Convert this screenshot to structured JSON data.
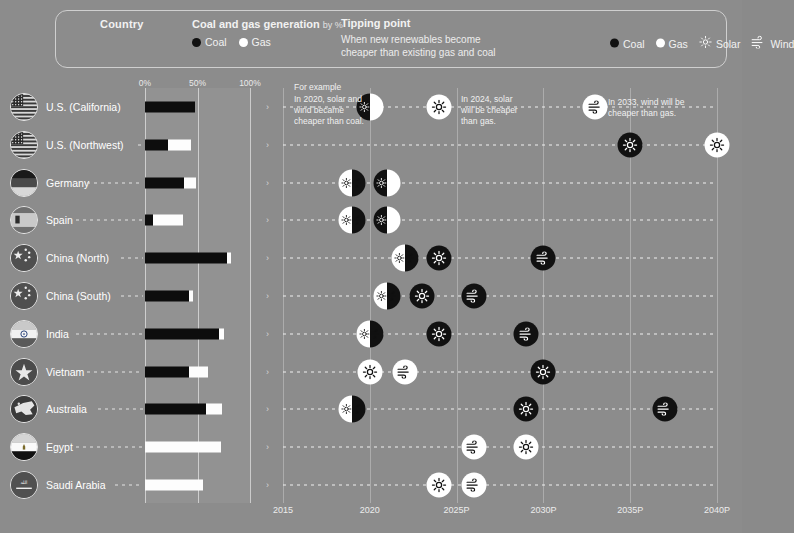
{
  "header": {
    "country_label": "Country",
    "generation_title": "Coal and gas generation",
    "generation_sub": "by %",
    "generation_legend": [
      {
        "name": "coal",
        "label": "Coal",
        "color": "#111111"
      },
      {
        "name": "gas",
        "label": "Gas",
        "color": "#ffffff"
      }
    ],
    "tipping_title": "Tipping point",
    "tipping_sub_line1": "When new renewables become",
    "tipping_sub_line2": "cheaper than existing gas and coal",
    "tipping_legend": [
      {
        "name": "coal",
        "label": "Coal",
        "icon": "filled-circle-icon"
      },
      {
        "name": "gas",
        "label": "Gas",
        "icon": "open-circle-icon"
      },
      {
        "name": "solar",
        "label": "Solar",
        "icon": "solar-icon"
      },
      {
        "name": "wind",
        "label": "Wind",
        "icon": "wind-icon"
      }
    ]
  },
  "bar_axis": {
    "ticks": [
      "0%",
      "50%",
      "100%"
    ],
    "values": [
      0,
      50,
      100
    ]
  },
  "timeline_axis": {
    "ticks": [
      "2015",
      "2020",
      "2025P",
      "2030P",
      "2035P",
      "2040P"
    ],
    "values": [
      2015,
      2020,
      2025,
      2030,
      2035,
      2040
    ],
    "min": 2015,
    "max": 2040
  },
  "annotations": [
    {
      "name": "for-example-label",
      "text": "For example"
    },
    {
      "name": "anno-2020",
      "line1": "In 2020, solar and",
      "line2": "wind became",
      "line3": "cheaper than coal."
    },
    {
      "name": "anno-2024",
      "line1": "In 2024, solar",
      "line2": "will be cheaper",
      "line3": "than gas."
    },
    {
      "name": "anno-2033",
      "line1": "In 2033, wind will be",
      "line2": "cheaper than gas.",
      "line3": ""
    }
  ],
  "chart_data": {
    "type": "bar",
    "xlabel": "",
    "ylabel": "",
    "categories": [
      "U.S. (California)",
      "U.S. (Northwest)",
      "Germany",
      "Spain",
      "China (North)",
      "China (South)",
      "India",
      "Vietnam",
      "Australia",
      "Egypt",
      "Saudi Arabia"
    ],
    "series": [
      {
        "name": "Coal",
        "values": [
          48,
          22,
          37,
          8,
          78,
          42,
          70,
          42,
          58,
          0,
          0
        ]
      },
      {
        "name": "Gas",
        "values": [
          0,
          22,
          12,
          28,
          4,
          4,
          5,
          18,
          15,
          72,
          55
        ]
      }
    ],
    "ylim": [
      0,
      100
    ],
    "grid": true,
    "legend": "top"
  },
  "rows": [
    {
      "name": "U.S. (California)",
      "flag": "usa-flag-icon",
      "coal": 48,
      "gas": 0,
      "markers": [
        {
          "year": 2020,
          "type": "solar-wind",
          "fill": "black"
        },
        {
          "year": 2024,
          "type": "solar",
          "fill": "white"
        },
        {
          "year": 2033,
          "type": "wind",
          "fill": "white"
        }
      ]
    },
    {
      "name": "U.S. (Northwest)",
      "flag": "usa-flag-icon",
      "coal": 22,
      "gas": 22,
      "markers": [
        {
          "year": 2035,
          "type": "solar",
          "fill": "black"
        },
        {
          "year": 2040,
          "type": "solar",
          "fill": "white"
        }
      ]
    },
    {
      "name": "Germany",
      "flag": "germany-flag-icon",
      "coal": 37,
      "gas": 12,
      "markers": [
        {
          "year": 2019,
          "type": "solar-wind",
          "fill": "white"
        },
        {
          "year": 2021,
          "type": "solar-wind",
          "fill": "black"
        }
      ]
    },
    {
      "name": "Spain",
      "flag": "spain-flag-icon",
      "coal": 8,
      "gas": 28,
      "markers": [
        {
          "year": 2019,
          "type": "solar-wind",
          "fill": "white"
        },
        {
          "year": 2021,
          "type": "solar-wind",
          "fill": "black"
        }
      ]
    },
    {
      "name": "China (North)",
      "flag": "china-flag-icon",
      "coal": 78,
      "gas": 4,
      "markers": [
        {
          "year": 2022,
          "type": "solar-wind",
          "fill": "white"
        },
        {
          "year": 2024,
          "type": "solar",
          "fill": "black"
        },
        {
          "year": 2030,
          "type": "wind",
          "fill": "black"
        }
      ]
    },
    {
      "name": "China (South)",
      "flag": "china-flag-icon",
      "coal": 42,
      "gas": 4,
      "markers": [
        {
          "year": 2021,
          "type": "solar-wind",
          "fill": "white"
        },
        {
          "year": 2023,
          "type": "solar",
          "fill": "black"
        },
        {
          "year": 2026,
          "type": "wind",
          "fill": "black"
        }
      ]
    },
    {
      "name": "India",
      "flag": "india-flag-icon",
      "coal": 70,
      "gas": 5,
      "markers": [
        {
          "year": 2020,
          "type": "solar-wind",
          "fill": "white"
        },
        {
          "year": 2024,
          "type": "solar",
          "fill": "black"
        },
        {
          "year": 2029,
          "type": "wind",
          "fill": "black"
        }
      ]
    },
    {
      "name": "Vietnam",
      "flag": "vietnam-flag-icon",
      "coal": 42,
      "gas": 18,
      "markers": [
        {
          "year": 2020,
          "type": "solar",
          "fill": "white"
        },
        {
          "year": 2022,
          "type": "wind",
          "fill": "white"
        },
        {
          "year": 2030,
          "type": "solar",
          "fill": "black"
        }
      ]
    },
    {
      "name": "Australia",
      "flag": "australia-flag-icon",
      "coal": 58,
      "gas": 15,
      "markers": [
        {
          "year": 2019,
          "type": "solar-wind",
          "fill": "white"
        },
        {
          "year": 2029,
          "type": "solar",
          "fill": "black"
        },
        {
          "year": 2037,
          "type": "wind",
          "fill": "black"
        }
      ]
    },
    {
      "name": "Egypt",
      "flag": "egypt-flag-icon",
      "coal": 0,
      "gas": 72,
      "markers": [
        {
          "year": 2026,
          "type": "wind",
          "fill": "white"
        },
        {
          "year": 2029,
          "type": "solar",
          "fill": "white"
        }
      ]
    },
    {
      "name": "Saudi Arabia",
      "flag": "saudi-flag-icon",
      "coal": 0,
      "gas": 55,
      "markers": [
        {
          "year": 2024,
          "type": "solar",
          "fill": "white"
        },
        {
          "year": 2026,
          "type": "wind",
          "fill": "white"
        }
      ]
    }
  ]
}
